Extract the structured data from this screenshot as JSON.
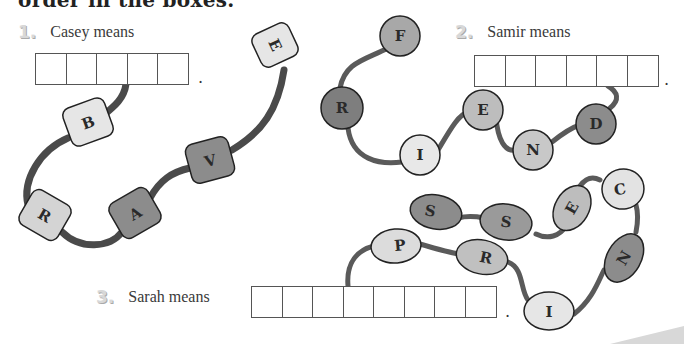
{
  "heading": "order in the boxes.",
  "colors": {
    "string": "#5a5a5a",
    "bead_light": "#e6e6e6",
    "bead_mid": "#bdbdbd",
    "bead_dark": "#8c8c8c",
    "outline": "#222222",
    "box_border": "#555555"
  },
  "puzzles": [
    {
      "number": "1.",
      "prompt": "Casey means",
      "box_count": 5,
      "bead_shape": "barrel",
      "beads": [
        {
          "letter": "E",
          "shade": "light"
        },
        {
          "letter": "V",
          "shade": "dark"
        },
        {
          "letter": "A",
          "shade": "dark"
        },
        {
          "letter": "R",
          "shade": "light"
        },
        {
          "letter": "B",
          "shade": "light"
        }
      ],
      "period": "."
    },
    {
      "number": "2.",
      "prompt": "Samir means",
      "box_count": 6,
      "bead_shape": "circle",
      "beads": [
        {
          "letter": "F",
          "shade": "mid"
        },
        {
          "letter": "R",
          "shade": "dark"
        },
        {
          "letter": "I",
          "shade": "light"
        },
        {
          "letter": "E",
          "shade": "mid"
        },
        {
          "letter": "N",
          "shade": "mid"
        },
        {
          "letter": "D",
          "shade": "dark"
        }
      ],
      "period": "."
    },
    {
      "number": "3.",
      "prompt": "Sarah means",
      "box_count": 8,
      "bead_shape": "oval",
      "beads": [
        {
          "letter": "S",
          "shade": "dark"
        },
        {
          "letter": "S",
          "shade": "dark"
        },
        {
          "letter": "E",
          "shade": "mid"
        },
        {
          "letter": "C",
          "shade": "light"
        },
        {
          "letter": "N",
          "shade": "dark"
        },
        {
          "letter": "I",
          "shade": "light"
        },
        {
          "letter": "R",
          "shade": "mid"
        },
        {
          "letter": "P",
          "shade": "light"
        }
      ],
      "period": "."
    }
  ]
}
